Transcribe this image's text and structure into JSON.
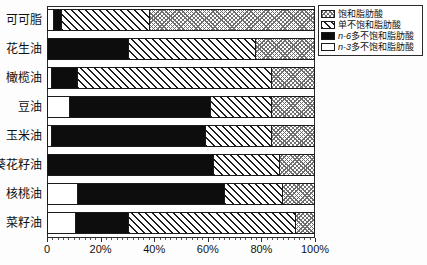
{
  "chart_data": {
    "type": "bar",
    "orientation": "horizontal",
    "stacked": "100%",
    "title": "",
    "xlabel": "",
    "ylabel": "",
    "xlim": [
      0,
      100
    ],
    "grid": false,
    "legend_position": "top-right",
    "tick_labels": [
      "0",
      "20%",
      "40%",
      "60%",
      "80%",
      "100%"
    ],
    "tick_values": [
      0,
      20,
      40,
      60,
      80,
      100
    ],
    "categories": [
      "可可脂",
      "花生油",
      "橄榄油",
      "豆油",
      "玉米油",
      "葵花籽油",
      "核桃油",
      "菜籽油"
    ],
    "series": [
      {
        "name": "饱和脂肪酸",
        "pattern": "gray-crosshatch",
        "values": [
          62,
          22,
          16,
          16,
          16,
          13,
          12,
          7
        ]
      },
      {
        "name": "单不饱和脂肪酸",
        "pattern": "diagonal-hatch",
        "values": [
          33,
          48,
          73,
          23,
          25,
          25,
          22,
          63
        ]
      },
      {
        "name": "n-6多不饱和脂肪酸",
        "pattern": "solid-black",
        "values": [
          3,
          30,
          10,
          53,
          58,
          62,
          55,
          20
        ]
      },
      {
        "name": "n-3多不饱和脂肪酸",
        "pattern": "white",
        "values": [
          2,
          0,
          1,
          8,
          1,
          0,
          11,
          10
        ]
      }
    ]
  },
  "legend": {
    "items": [
      {
        "label": "饱和脂肪酸",
        "prefix": "",
        "pattern": "gray-crosshatch"
      },
      {
        "label": "单不饱和脂肪酸",
        "prefix": "",
        "pattern": "diagonal-hatch"
      },
      {
        "label": "多不饱和脂肪酸",
        "prefix": "n-6",
        "pattern": "solid-black"
      },
      {
        "label": "多不饱和脂肪酸",
        "prefix": "n-3",
        "pattern": "white"
      }
    ]
  }
}
